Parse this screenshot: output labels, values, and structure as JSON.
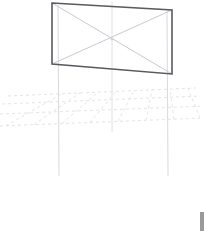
{
  "viewport": {
    "width": 204,
    "height": 232,
    "background_color": "#ffffff",
    "label": "3D perspective viewport"
  },
  "scene": {
    "name": "billboard-sign-structure",
    "description": "Wireframe billboard panel with X bracing supported on two vertical posts above a dashed perspective ground grid"
  },
  "colors": {
    "panel_edge": "#5a5a60",
    "panel_diagonal": "#c9c9cf",
    "post": "#d9d9de",
    "grid_dash": "#e4e4ea",
    "center_axis": "#e0e0e6",
    "scrollbar_thumb": "#9a9a9a",
    "background": "#ffffff"
  },
  "panel": {
    "name": "billboard-panel",
    "corners": {
      "top_left": [
        52,
        3
      ],
      "top_right": [
        172,
        10
      ],
      "bottom_right": [
        172,
        74
      ],
      "bottom_left": [
        52,
        64
      ]
    },
    "edge_width": 1.6,
    "diagonals": [
      [
        [
          52,
          3
        ],
        [
          172,
          74
        ]
      ],
      [
        [
          172,
          10
        ],
        [
          52,
          64
        ]
      ]
    ],
    "center_vertex": [
      112,
      39
    ]
  },
  "posts": [
    {
      "name": "post-left",
      "top": [
        58,
        5
      ],
      "bottom": [
        59,
        176
      ],
      "width": 1
    },
    {
      "name": "post-right",
      "top": [
        167,
        11
      ],
      "bottom": [
        168,
        176
      ],
      "width": 1
    }
  ],
  "center_axis": {
    "name": "center-axis-line",
    "top": [
      112,
      2
    ],
    "bottom": [
      112,
      132
    ],
    "width": 1
  },
  "ground_grid": {
    "name": "perspective-ground-grid",
    "style": "dashed",
    "dash_pattern": "3 3",
    "horizon_rows": [
      {
        "y_left": 96,
        "y_right": 88,
        "x_left": 8,
        "x_right": 196
      },
      {
        "y_left": 104,
        "y_right": 96,
        "x_left": 2,
        "x_right": 202
      },
      {
        "y_left": 114,
        "y_right": 106,
        "x_left": 0,
        "x_right": 204
      },
      {
        "y_left": 126,
        "y_right": 118,
        "x_left": 0,
        "x_right": 204
      }
    ],
    "depth_lines": [
      {
        "x_near": 6,
        "x_far": 62
      },
      {
        "x_near": 34,
        "x_far": 80
      },
      {
        "x_near": 62,
        "x_far": 98
      },
      {
        "x_near": 90,
        "x_far": 116
      },
      {
        "x_near": 118,
        "x_far": 134
      },
      {
        "x_near": 146,
        "x_far": 152
      },
      {
        "x_near": 174,
        "x_far": 170
      },
      {
        "x_near": 200,
        "x_far": 188
      }
    ]
  },
  "scrollbar": {
    "name": "vertical-scrollbar",
    "position": "bottom-right",
    "thumb_height": 19
  }
}
